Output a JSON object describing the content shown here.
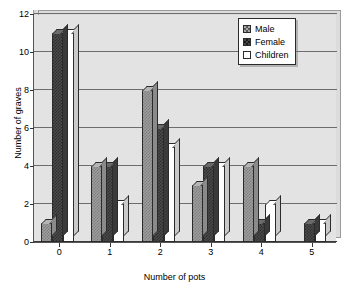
{
  "chart_data": {
    "type": "bar",
    "title": "",
    "xlabel": "Number of pots",
    "ylabel": "Number of graves",
    "categories": [
      "0",
      "1",
      "2",
      "3",
      "4",
      "5"
    ],
    "series": [
      {
        "name": "Male",
        "values": [
          1,
          4,
          8,
          3,
          4,
          0
        ]
      },
      {
        "name": "Female",
        "values": [
          11,
          4,
          6,
          4,
          1,
          1
        ]
      },
      {
        "name": "Children",
        "values": [
          11,
          2,
          5,
          4,
          2,
          1
        ]
      }
    ],
    "ylim": [
      0,
      12
    ],
    "yticks": [
      0,
      2,
      4,
      6,
      8,
      10,
      12
    ],
    "grid": true,
    "legend_position": "top-right",
    "style": "3d-clustered-column",
    "colors": {
      "male": "#9d9d9d",
      "female": "#4a4a4a",
      "children": "#ffffff",
      "plot_background": "#e3e3e3",
      "gridline": "#6d6d6d",
      "axis": "#333333"
    }
  },
  "legend": {
    "items": [
      {
        "label": "Male",
        "swatch": "hatched-gray-swatch"
      },
      {
        "label": "Female",
        "swatch": "hatched-dark-swatch"
      },
      {
        "label": "Children",
        "swatch": "white-swatch"
      }
    ]
  }
}
